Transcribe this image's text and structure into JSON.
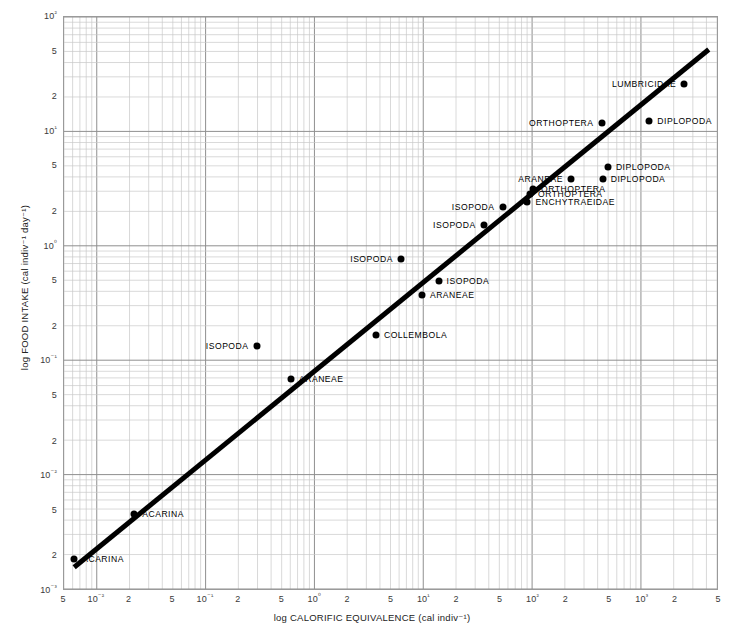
{
  "chart_data": {
    "type": "scatter",
    "title": "",
    "xlabel": "log CALORIFIC EQUIVALENCE (cal indiv⁻¹)",
    "ylabel": "log FOOD INTAKE (cal indiv⁻¹ day⁻¹)",
    "scale": {
      "x": "log",
      "y": "log"
    },
    "xlim": [
      0.005,
      5000
    ],
    "ylim": [
      0.001,
      100
    ],
    "grid": true,
    "legend": "none",
    "x_tick_labels": [
      "5",
      "10⁻²",
      "2",
      "5",
      "10⁻¹",
      "2",
      "5",
      "10⁰",
      "2",
      "5",
      "10¹",
      "2",
      "5",
      "10²",
      "2",
      "5",
      "10³",
      "2",
      "5"
    ],
    "x_tick_values": [
      0.005,
      0.01,
      0.02,
      0.05,
      0.1,
      0.2,
      0.5,
      1,
      2,
      5,
      10,
      20,
      50,
      100,
      200,
      500,
      1000,
      2000,
      5000
    ],
    "y_tick_labels": [
      "10²",
      "5",
      "2",
      "10¹",
      "5",
      "2",
      "10⁰",
      "5",
      "2",
      "10⁻¹",
      "5",
      "2",
      "10⁻²",
      "5",
      "2",
      "10⁻³"
    ],
    "y_tick_values": [
      100,
      50,
      20,
      10,
      5,
      2,
      1,
      0.5,
      0.2,
      0.1,
      0.05,
      0.02,
      0.01,
      0.005,
      0.002,
      0.001
    ],
    "trend_line": {
      "style": "solid",
      "color": "#000000",
      "width_px": 5,
      "x_start": 0.0062,
      "y_start": 0.00155,
      "x_end": 4200,
      "y_end": 52
    },
    "points": [
      {
        "label": "ACARINA",
        "x": 0.0062,
        "y": 0.0019,
        "label_side": "right"
      },
      {
        "label": "ACARINA",
        "x": 0.022,
        "y": 0.0047,
        "label_side": "right"
      },
      {
        "label": "ARANEAE",
        "x": 0.6,
        "y": 0.07,
        "label_side": "right"
      },
      {
        "label": "ISOPODA",
        "x": 0.29,
        "y": 0.135,
        "label_side": "left"
      },
      {
        "label": "COLLEMBOLA",
        "x": 3.6,
        "y": 0.17,
        "label_side": "right"
      },
      {
        "label": "ARANEAE",
        "x": 9.5,
        "y": 0.38,
        "label_side": "right"
      },
      {
        "label": "ISOPODA",
        "x": 13.5,
        "y": 0.5,
        "label_side": "right"
      },
      {
        "label": "ISOPODA",
        "x": 6.1,
        "y": 0.78,
        "label_side": "left"
      },
      {
        "label": "ISOPODA",
        "x": 35,
        "y": 1.55,
        "label_side": "left"
      },
      {
        "label": "ISOPODA",
        "x": 52,
        "y": 2.2,
        "label_side": "left"
      },
      {
        "label": "ENCHYTRAEIDAE",
        "x": 88,
        "y": 2.45,
        "label_side": "right"
      },
      {
        "label": "ORTHOPTERA",
        "x": 93,
        "y": 2.9,
        "label_side": "right"
      },
      {
        "label": "ORTHOPTERA",
        "x": 99,
        "y": 3.2,
        "label_side": "right"
      },
      {
        "label": "ARANEAE",
        "x": 220,
        "y": 3.9,
        "label_side": "left"
      },
      {
        "label": "DIPLOPODA",
        "x": 430,
        "y": 3.9,
        "label_side": "right"
      },
      {
        "label": "DIPLOPODA",
        "x": 480,
        "y": 4.9,
        "label_side": "right"
      },
      {
        "label": "ORTHOPTERA",
        "x": 420,
        "y": 12.0,
        "label_side": "left"
      },
      {
        "label": "DIPLOPODA",
        "x": 1150,
        "y": 12.5,
        "label_side": "right"
      },
      {
        "label": "LUMBRICIDAE",
        "x": 2400,
        "y": 26.0,
        "label_side": "left"
      }
    ]
  }
}
